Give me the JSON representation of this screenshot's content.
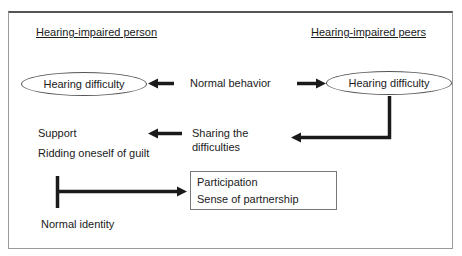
{
  "diagram": {
    "columns": {
      "left_heading": "Hearing-impaired person",
      "right_heading": "Hearing-impaired peers"
    },
    "nodes": {
      "left_ellipse": "Hearing difficulty",
      "right_ellipse": "Hearing difficulty",
      "normal_behavior": "Normal behavior",
      "sharing_line1": "Sharing the",
      "sharing_line2": "difficulties",
      "support": "Support",
      "ridding_guilt": "Ridding oneself of guilt",
      "outcome_box": {
        "line1": "Participation",
        "line2": "Sense of partnership"
      },
      "normal_identity": "Normal identity"
    },
    "edges": [
      {
        "from": "normal_behavior",
        "to": "left_ellipse"
      },
      {
        "from": "normal_behavior",
        "to": "right_ellipse"
      },
      {
        "from": "right_ellipse",
        "to": "sharing_the_difficulties"
      },
      {
        "from": "sharing_the_difficulties",
        "to": "support"
      },
      {
        "from": "normal_identity",
        "to": "outcome_box"
      }
    ],
    "colors": {
      "stroke": "#1a1a1a",
      "frame": "#9a9a9a",
      "background": "#ffffff"
    }
  }
}
